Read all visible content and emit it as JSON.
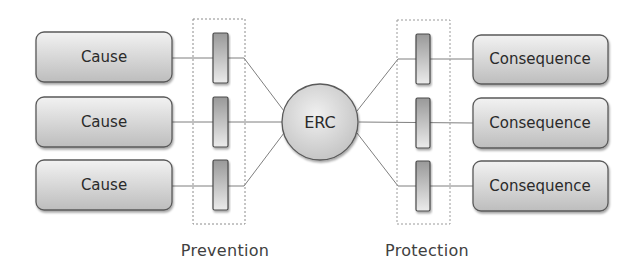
{
  "diagram": {
    "type": "bowtie",
    "center": {
      "label": "ERC"
    },
    "causes": [
      {
        "label": "Cause"
      },
      {
        "label": "Cause"
      },
      {
        "label": "Cause"
      }
    ],
    "consequences": [
      {
        "label": "Consequence"
      },
      {
        "label": "Consequence"
      },
      {
        "label": "Consequence"
      }
    ],
    "groups": {
      "prevention": {
        "label": "Prevention"
      },
      "protection": {
        "label": "Protection"
      }
    },
    "colors": {
      "box_fill_top": "#f2f2f2",
      "box_fill_bottom": "#bfbfbf",
      "box_stroke": "#5a5a5a",
      "line": "#7f7f7f",
      "dotted_frame": "#8c8c8c",
      "barrier_top": "#9a9a9a",
      "barrier_bottom": "#e6e6e6"
    }
  }
}
